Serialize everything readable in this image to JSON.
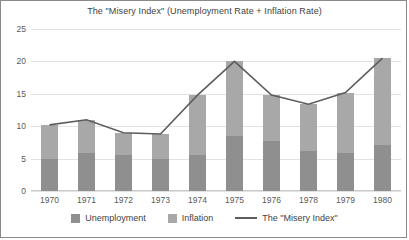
{
  "chart_data": {
    "type": "bar",
    "title": "The \"Misery Index\" (Unemployment Rate + Inflation Rate)",
    "xlabel": "",
    "ylabel": "",
    "ylim": [
      0,
      25
    ],
    "ytick_step": 5,
    "yticks": [
      0,
      5,
      10,
      15,
      20,
      25
    ],
    "grid": true,
    "stacked": true,
    "legend_position": "bottom-center",
    "categories": [
      "1970",
      "1971",
      "1972",
      "1973",
      "1974",
      "1975",
      "1976",
      "1978",
      "1979",
      "1980"
    ],
    "series": [
      {
        "name": "Unemployment",
        "color": "#8f8f8f",
        "values": [
          4.9,
          5.9,
          5.6,
          4.9,
          5.6,
          8.5,
          7.7,
          6.1,
          5.8,
          7.1
        ]
      },
      {
        "name": "Inflation",
        "color": "#a8a8a8",
        "values": [
          5.3,
          5.1,
          3.4,
          3.9,
          9.2,
          11.5,
          7.1,
          7.3,
          9.4,
          13.4
        ]
      }
    ],
    "line_series": {
      "name": "The \"Misery Index\"",
      "color": "#5d5d5d",
      "values": [
        10.2,
        11.0,
        9.0,
        8.8,
        14.8,
        20.0,
        14.8,
        13.4,
        15.2,
        20.5
      ]
    },
    "legend": [
      {
        "label": "Unemployment",
        "marker": "square",
        "color": "#8f8f8f"
      },
      {
        "label": "Inflation",
        "marker": "square",
        "color": "#a8a8a8"
      },
      {
        "label": "The \"Misery Index\"",
        "marker": "line",
        "color": "#5d5d5d"
      }
    ]
  }
}
